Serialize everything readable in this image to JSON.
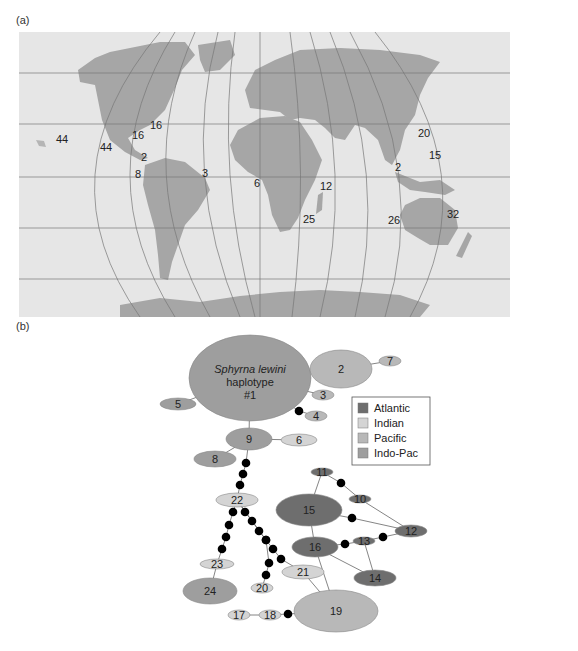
{
  "panel_a": {
    "label": "(a)",
    "map": {
      "ocean_color": "#e6e6e6",
      "land_color": "#a6a6a6",
      "shelf_color": "#cfcfcf",
      "grid_color": "#777777",
      "sample_counts": [
        {
          "value": "44",
          "x": 56,
          "y": 143
        },
        {
          "value": "44",
          "x": 100,
          "y": 151
        },
        {
          "value": "16",
          "x": 150,
          "y": 129
        },
        {
          "value": "16",
          "x": 132,
          "y": 139
        },
        {
          "value": "2",
          "x": 141,
          "y": 161
        },
        {
          "value": "8",
          "x": 135,
          "y": 178
        },
        {
          "value": "3",
          "x": 202,
          "y": 177
        },
        {
          "value": "6",
          "x": 254,
          "y": 187
        },
        {
          "value": "12",
          "x": 320,
          "y": 190
        },
        {
          "value": "25",
          "x": 303,
          "y": 223
        },
        {
          "value": "20",
          "x": 418,
          "y": 137
        },
        {
          "value": "15",
          "x": 429,
          "y": 159
        },
        {
          "value": "2",
          "x": 395,
          "y": 171
        },
        {
          "value": "26",
          "x": 388,
          "y": 224
        },
        {
          "value": "32",
          "x": 447,
          "y": 218
        }
      ]
    }
  },
  "panel_b": {
    "label": "(b)",
    "colors": {
      "Atlantic": "#6e6e6e",
      "Indian": "#d4d4d4",
      "Pacific": "#b8b8b8",
      "Indo-Pac": "#9e9e9e",
      "mutation": "#000000",
      "edge": "#666666"
    },
    "title_node": {
      "line1": "Sphyrna lewini",
      "line2": "haplotype",
      "line3": "#1"
    },
    "legend": {
      "items": [
        {
          "label": "Atlantic",
          "color": "#6e6e6e"
        },
        {
          "label": "Indian",
          "color": "#d4d4d4"
        },
        {
          "label": "Pacific",
          "color": "#b8b8b8"
        },
        {
          "label": "Indo-Pac",
          "color": "#9e9e9e"
        }
      ]
    },
    "nodes": [
      {
        "id": "1",
        "label": "#1",
        "region": "Indo-Pac",
        "cx": 250,
        "cy": 378,
        "rx": 61,
        "ry": 43
      },
      {
        "id": "2",
        "label": "2",
        "region": "Pacific",
        "cx": 341,
        "cy": 369,
        "rx": 31,
        "ry": 19
      },
      {
        "id": "3",
        "label": "3",
        "region": "Pacific",
        "cx": 323,
        "cy": 395,
        "rx": 11,
        "ry": 5
      },
      {
        "id": "4",
        "label": "4",
        "region": "Pacific",
        "cx": 316,
        "cy": 416,
        "rx": 11,
        "ry": 5
      },
      {
        "id": "5",
        "label": "5",
        "region": "Indo-Pac",
        "cx": 178,
        "cy": 404,
        "rx": 18,
        "ry": 6
      },
      {
        "id": "6",
        "label": "6",
        "region": "Indian",
        "cx": 299,
        "cy": 440,
        "rx": 18,
        "ry": 6
      },
      {
        "id": "7",
        "label": "7",
        "region": "Pacific",
        "cx": 390,
        "cy": 361,
        "rx": 11,
        "ry": 5
      },
      {
        "id": "8",
        "label": "8",
        "region": "Indo-Pac",
        "cx": 215,
        "cy": 459,
        "rx": 21,
        "ry": 8
      },
      {
        "id": "9",
        "label": "9",
        "region": "Indo-Pac",
        "cx": 249,
        "cy": 439,
        "rx": 23,
        "ry": 11
      },
      {
        "id": "10",
        "label": "10",
        "region": "Atlantic",
        "cx": 360,
        "cy": 499,
        "rx": 11,
        "ry": 4
      },
      {
        "id": "11",
        "label": "11",
        "region": "Atlantic",
        "cx": 322,
        "cy": 472,
        "rx": 11,
        "ry": 4
      },
      {
        "id": "12",
        "label": "12",
        "region": "Atlantic",
        "cx": 411,
        "cy": 531,
        "rx": 16,
        "ry": 6
      },
      {
        "id": "13",
        "label": "13",
        "region": "Atlantic",
        "cx": 364,
        "cy": 541,
        "rx": 11,
        "ry": 4
      },
      {
        "id": "14",
        "label": "14",
        "region": "Atlantic",
        "cx": 375,
        "cy": 578,
        "rx": 21,
        "ry": 8
      },
      {
        "id": "15",
        "label": "15",
        "region": "Atlantic",
        "cx": 309,
        "cy": 510,
        "rx": 33,
        "ry": 16
      },
      {
        "id": "16",
        "label": "16",
        "region": "Atlantic",
        "cx": 315,
        "cy": 547,
        "rx": 23,
        "ry": 10
      },
      {
        "id": "17",
        "label": "17",
        "region": "Indian",
        "cx": 239,
        "cy": 615,
        "rx": 11,
        "ry": 5
      },
      {
        "id": "18",
        "label": "18",
        "region": "Indian",
        "cx": 270,
        "cy": 615,
        "rx": 11,
        "ry": 5
      },
      {
        "id": "19",
        "label": "19",
        "region": "Pacific",
        "cx": 336,
        "cy": 611,
        "rx": 42,
        "ry": 21
      },
      {
        "id": "20",
        "label": "20",
        "region": "Indian",
        "cx": 262,
        "cy": 588,
        "rx": 11,
        "ry": 5
      },
      {
        "id": "21",
        "label": "21",
        "region": "Indian",
        "cx": 303,
        "cy": 572,
        "rx": 21,
        "ry": 7
      },
      {
        "id": "22",
        "label": "22",
        "region": "Indian",
        "cx": 237,
        "cy": 500,
        "rx": 21,
        "ry": 7
      },
      {
        "id": "23",
        "label": "23",
        "region": "Indian",
        "cx": 217,
        "cy": 564,
        "rx": 17,
        "ry": 5
      },
      {
        "id": "24",
        "label": "24",
        "region": "Indo-Pac",
        "cx": 210,
        "cy": 591,
        "rx": 27,
        "ry": 13
      }
    ],
    "edges": [
      [
        "1",
        "2"
      ],
      [
        "2",
        "7"
      ],
      [
        "1",
        "3"
      ],
      [
        "1",
        "5"
      ],
      [
        "1",
        "9"
      ],
      [
        "9",
        "6"
      ],
      [
        "9",
        "8"
      ],
      [
        "11",
        "15"
      ],
      [
        "15",
        "16"
      ],
      [
        "16",
        "19"
      ],
      [
        "21",
        "19"
      ],
      [
        "23",
        "24"
      ],
      [
        "17",
        "18"
      ],
      [
        "16",
        "14"
      ],
      [
        "13",
        "14"
      ],
      [
        "10",
        "12"
      ]
    ],
    "mutation_paths": [
      {
        "from": "1",
        "to": "4",
        "points": [
          [
            299,
            411
          ]
        ]
      },
      {
        "from": "9",
        "to": "22",
        "points": [
          [
            246,
            463
          ],
          [
            243,
            474
          ],
          [
            240,
            485
          ]
        ]
      },
      {
        "from": "22",
        "to": "23",
        "points": [
          [
            233,
            512
          ],
          [
            229,
            525
          ],
          [
            226,
            537
          ],
          [
            222,
            549
          ]
        ]
      },
      {
        "from": "22",
        "to": "21",
        "points": [
          [
            245,
            512
          ],
          [
            252,
            521
          ],
          [
            259,
            531
          ],
          [
            266,
            540
          ],
          [
            273,
            549
          ],
          [
            281,
            559
          ]
        ]
      },
      {
        "from": "22",
        "to": "20",
        "points": [
          [
            266,
            540
          ],
          [
            269,
            563
          ],
          [
            266,
            575
          ]
        ]
      },
      {
        "from": "11",
        "to": "10",
        "points": [
          [
            341,
            483
          ]
        ]
      },
      {
        "from": "15",
        "to": "12",
        "points": [
          [
            352,
            518
          ]
        ]
      },
      {
        "from": "13",
        "to": "12",
        "points": [
          [
            383,
            537
          ]
        ]
      },
      {
        "from": "16",
        "to": "13",
        "points": [
          [
            345,
            544
          ]
        ]
      },
      {
        "from": "18",
        "to": "19",
        "points": [
          [
            288,
            614
          ]
        ]
      }
    ]
  }
}
